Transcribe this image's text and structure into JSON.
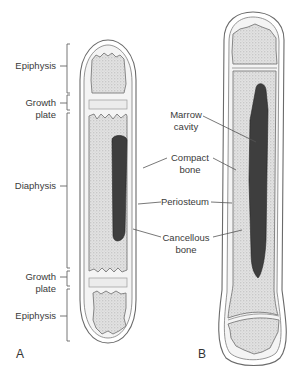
{
  "figure": {
    "panels": [
      {
        "id": "A",
        "label": "A"
      },
      {
        "id": "B",
        "label": "B"
      }
    ],
    "left_labels": {
      "epiphysis_top": "Epiphysis",
      "growth_plate_top_line1": "Growth",
      "growth_plate_top_line2": "plate",
      "diaphysis": "Diaphysis",
      "growth_plate_bottom_line1": "Growth",
      "growth_plate_bottom_line2": "plate",
      "epiphysis_bottom": "Epiphysis"
    },
    "middle_labels": {
      "marrow_cavity_line1": "Marrow",
      "marrow_cavity_line2": "cavity",
      "compact_bone_line1": "Compact",
      "compact_bone_line2": "bone",
      "periosteum": "Periosteum",
      "cancellous_bone_line1": "Cancellous",
      "cancellous_bone_line2": "bone"
    },
    "colors": {
      "marrow": "#3e3e3e",
      "spongy_bone": "#d8d8d8",
      "outline": "#6a6a6a",
      "background": "#ffffff"
    }
  }
}
